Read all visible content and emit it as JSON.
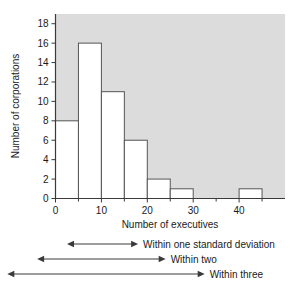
{
  "chart_data": {
    "type": "bar",
    "title": "",
    "subtitle": "",
    "xlabel": "Number of executives",
    "ylabel": "Number of corporations",
    "xlim": [
      0,
      50
    ],
    "ylim": [
      0,
      19
    ],
    "grid": false,
    "legend": null,
    "bin_width": 5,
    "bin_edges": [
      0,
      5,
      10,
      15,
      20,
      25,
      30,
      35,
      40,
      45
    ],
    "categories": [
      "0-5",
      "5-10",
      "10-15",
      "15-20",
      "20-25",
      "25-30",
      "30-35",
      "35-40",
      "40-45"
    ],
    "values": [
      8,
      16,
      11,
      6,
      2,
      1,
      0,
      0,
      1
    ],
    "x_ticks": [
      0,
      10,
      20,
      30,
      40
    ],
    "x_tick_labels": [
      "0",
      "10",
      "20",
      "30",
      "40"
    ],
    "x_minor_ticks": [
      5,
      15,
      25,
      35,
      45
    ],
    "y_ticks": [
      0,
      2,
      4,
      6,
      8,
      10,
      12,
      14,
      16,
      18
    ],
    "y_tick_labels": [
      "0",
      "2",
      "4",
      "6",
      "8",
      "10",
      "12",
      "14",
      "16",
      "18"
    ],
    "plot_background_color": "#dcdcdc",
    "bar_fill_color": "#ffffff",
    "bar_edge_color": "#555555",
    "axis_color": "#3a3a3a",
    "annotations": [
      {
        "label": "Within one standard deviation",
        "x_start": 2.5,
        "x_end": 18.0
      },
      {
        "label": "Within two",
        "x_start": -4.0,
        "x_end": 24.0
      },
      {
        "label": "Within three",
        "x_start": -10.5,
        "x_end": 32.5
      }
    ]
  },
  "axis": {
    "x_title": "Number of executives",
    "y_title": "Number of corporations"
  },
  "annotations": {
    "one_sd": "Within one standard deviation",
    "two_sd": "Within two",
    "three_sd": "Within three"
  }
}
